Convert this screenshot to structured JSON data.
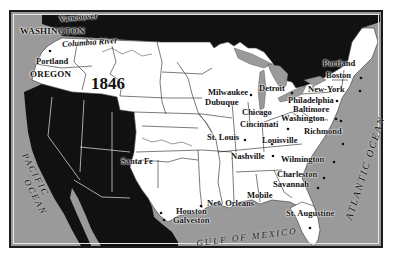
{
  "map": {
    "year": "1846",
    "colors": {
      "us_territory": "#ffffff",
      "foreign_territory": "#111111",
      "water": "#9a9a9a",
      "border": "#1a1a1a"
    },
    "regions": {
      "washington": "WASHINGTON",
      "oregon": "OREGON"
    },
    "water_bodies": {
      "pacific_1": "PACIFIC",
      "pacific_2": "OCEAN",
      "atlantic": "ATLANTIC OCEAN",
      "gulf": "GULF OF MEXICO",
      "columbia": "Columbia River"
    },
    "cities": {
      "vancouver": "Vancouver",
      "portland_or": "Portland",
      "santa_fe": "Santa Fe",
      "houston": "Houston",
      "galveston": "Galveston",
      "new_orleans": "New Orleans",
      "mobile": "Mobile",
      "st_augustine": "St. Augustine",
      "savannah": "Savannah",
      "charleston": "Charleston",
      "wilmington": "Wilmington",
      "richmond": "Richmond",
      "nashville": "Nashville",
      "louisville": "Louisville",
      "st_louis": "St. Louis",
      "cincinnati": "Cincinnati",
      "chicago": "Chicago",
      "dubuque": "Dubuque",
      "milwaukee": "Milwaukee",
      "detroit": "Detroit",
      "philadelphia": "Philadelphia",
      "baltimore": "Baltimore",
      "washington_dc": "Washington",
      "new_york": "New-York",
      "boston": "Boston",
      "portland_me": "Portland"
    }
  }
}
